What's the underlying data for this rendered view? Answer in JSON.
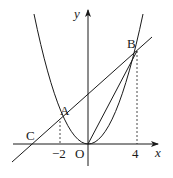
{
  "figure": {
    "type": "coordinate-diagram",
    "axes": {
      "x_label": "x",
      "y_label": "y",
      "origin_label": "O",
      "x_ticks": [
        {
          "value": -2,
          "label": "−2"
        },
        {
          "value": 4,
          "label": "4"
        }
      ]
    },
    "curves": [
      {
        "name": "parabola",
        "equation": "y = x^2/4",
        "description": "upward-opening parabola through origin"
      },
      {
        "name": "line AB",
        "description": "line through A(-2,1) and B(4,4), meeting x-axis at C"
      },
      {
        "name": "segment OB",
        "description": "segment from origin to B"
      }
    ],
    "points": [
      {
        "label": "A",
        "x": -2,
        "y": 1
      },
      {
        "label": "B",
        "x": 4,
        "y": 4
      },
      {
        "label": "C",
        "x": -4,
        "y": 0
      },
      {
        "label": "O",
        "x": 0,
        "y": 0
      }
    ],
    "dashed_guides": [
      {
        "from": "A",
        "to": "x-axis at -2"
      },
      {
        "from": "B",
        "to": "x-axis at 4"
      }
    ],
    "colors": {
      "stroke": "#1a1a1a",
      "background": "#ffffff"
    }
  }
}
